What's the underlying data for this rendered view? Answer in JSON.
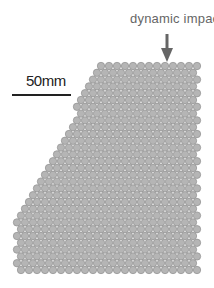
{
  "annotation": {
    "impact_label": "dynamic impact"
  },
  "scale": {
    "label": "50mm"
  },
  "colors": {
    "particle_fill": "#b5b5b5",
    "particle_stroke": "#8f8f8f",
    "arrow": "#666666"
  },
  "assembly": {
    "particle_diameter_px": 8,
    "row_pitch_px": 6.8,
    "top_y": 62,
    "bottom_y": 275,
    "right_x": 201,
    "left_edge": [
      [
        96,
        62
      ],
      [
        33,
        190
      ],
      [
        12,
        215
      ],
      [
        12,
        275
      ]
    ]
  }
}
